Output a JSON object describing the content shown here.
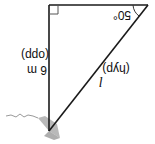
{
  "diagram": {
    "orientation": "rotated 180 degrees",
    "angle_label": "50°",
    "opposite_side": {
      "value": "6 m",
      "tag": "(opp)"
    },
    "hypotenuse": {
      "symbol": "l",
      "tag": "(hyp)"
    },
    "right_angle_marker": true,
    "colors": {
      "line": "#1a1a1a",
      "ground": "#9a9a9a"
    }
  }
}
